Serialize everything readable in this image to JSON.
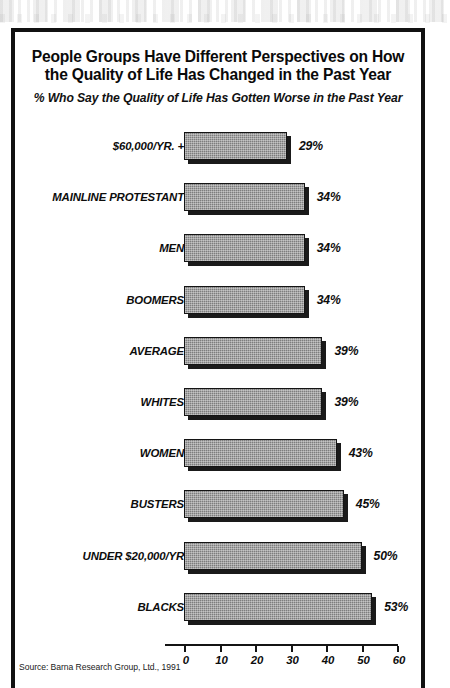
{
  "figure": {
    "title": "People Groups Have Different Perspectives on How the Quality of Life Has Changed in the Past Year",
    "subtitle": "% Who Say the Quality of Life Has Gotten Worse in the Past Year",
    "source": "Source: Barna Research Group, Ltd., 1991"
  },
  "chart_data": {
    "type": "bar",
    "orientation": "horizontal",
    "title": "People Groups Have Different Perspectives on How the Quality of Life Has Changed in the Past Year",
    "subtitle": "% Who Say the Quality of Life Has Gotten Worse in the Past Year",
    "xlabel": "",
    "ylabel": "",
    "xlim": [
      0,
      60
    ],
    "xticks": [
      0,
      10,
      20,
      30,
      40,
      50,
      60
    ],
    "xtick_labels": [
      "0",
      "10",
      "20",
      "30",
      "40",
      "50",
      "60"
    ],
    "grid": false,
    "legend": false,
    "value_suffix": "%",
    "bar_color": "#7d7d7d",
    "bar_edge_color": "#141414",
    "shadow_color": "#1a1a1a",
    "categories": [
      "$60,000/YR. +",
      "MAINLINE PROTESTANT",
      "MEN",
      "BOOMERS",
      "AVERAGE",
      "WHITES",
      "WOMEN",
      "BUSTERS",
      "UNDER $20,000/YR",
      "BLACKS"
    ],
    "values": [
      29,
      34,
      34,
      34,
      39,
      39,
      43,
      45,
      50,
      53
    ],
    "value_labels": [
      "29%",
      "34%",
      "34%",
      "34%",
      "39%",
      "39%",
      "43%",
      "45%",
      "50%",
      "53%"
    ],
    "source": "Source: Barna Research Group, Ltd., 1991"
  }
}
